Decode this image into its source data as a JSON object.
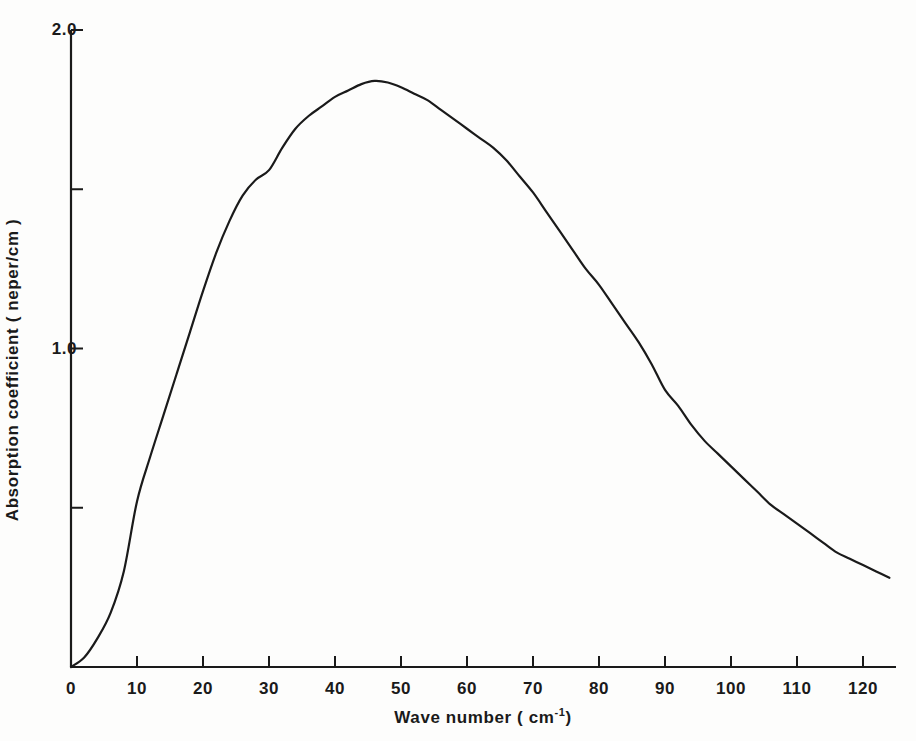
{
  "chart_data": {
    "type": "line",
    "title": "",
    "xlabel": "Wave number (cm-1)",
    "xlabel_base": "Wave number ( cm",
    "xlabel_sup": "-1",
    "xlabel_close": ")",
    "ylabel": "Absorption coefficient ( neper/cm )",
    "xlim": [
      0,
      124
    ],
    "ylim": [
      0,
      2.0
    ],
    "grid": false,
    "legend": false,
    "x_major_ticks": [
      0,
      10,
      20,
      30,
      40,
      50,
      60,
      70,
      80,
      90,
      100,
      110,
      120
    ],
    "x_tick_labels": [
      "0",
      "10",
      "20",
      "30",
      "40",
      "50",
      "60",
      "70",
      "80",
      "90",
      "100",
      "110",
      "120"
    ],
    "y_major_ticks": [
      1.0,
      2.0
    ],
    "y_tick_labels": [
      "1.0",
      "2.0"
    ],
    "y_minor_ticks": [
      0.5,
      1.5
    ],
    "line_color": "#1a1a1a",
    "line_width": 2.2,
    "series": [
      {
        "name": "Absorption coefficient",
        "x": [
          0,
          2,
          4,
          6,
          8,
          10,
          12,
          14,
          16,
          18,
          20,
          22,
          24,
          26,
          28,
          30,
          32,
          34,
          36,
          38,
          40,
          42,
          44,
          46,
          48,
          50,
          52,
          54,
          56,
          58,
          60,
          62,
          64,
          66,
          68,
          70,
          72,
          74,
          76,
          78,
          80,
          82,
          84,
          86,
          88,
          90,
          92,
          94,
          96,
          98,
          100,
          102,
          104,
          106,
          108,
          110,
          112,
          114,
          116,
          118,
          120,
          122,
          124
        ],
        "y": [
          0.0,
          0.03,
          0.09,
          0.17,
          0.3,
          0.52,
          0.66,
          0.79,
          0.92,
          1.05,
          1.18,
          1.3,
          1.4,
          1.48,
          1.53,
          1.56,
          1.63,
          1.69,
          1.73,
          1.76,
          1.79,
          1.81,
          1.83,
          1.84,
          1.835,
          1.82,
          1.8,
          1.78,
          1.75,
          1.72,
          1.69,
          1.66,
          1.63,
          1.59,
          1.54,
          1.49,
          1.43,
          1.37,
          1.31,
          1.25,
          1.2,
          1.14,
          1.08,
          1.02,
          0.95,
          0.87,
          0.82,
          0.76,
          0.71,
          0.67,
          0.63,
          0.59,
          0.55,
          0.51,
          0.48,
          0.45,
          0.42,
          0.39,
          0.36,
          0.34,
          0.32,
          0.3,
          0.28
        ]
      }
    ],
    "peak": {
      "x": 46,
      "y": 1.84
    }
  }
}
